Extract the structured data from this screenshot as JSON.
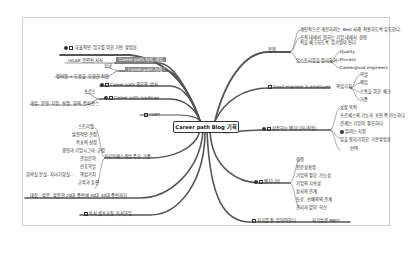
{
  "title": "Career path Blog 기획",
  "left": {
    "item1": "효율적인 업무를 위한 기반 방법론",
    "item2_label": "Career path 서식 개발",
    "item2_child": "ISCAR 관련된 서식",
    "item3_label": "Career path 사례",
    "item3_child_a": "신규",
    "item3_child_b": "정비원 + 도움을 요청한 직원",
    "item4": "Career path 개요와 방식",
    "item5": "Career path roadmap",
    "item5_child_a": "프로드",
    "item5_child_b": "개발, 운영, 지원, 설명, 회의, 컨퍼런스",
    "item6": "COPT",
    "item7": "커리어패스개발 주요 기준",
    "item7_children": [
      "스토리텔",
      "발전적인 관점",
      "목표의 설정",
      "경영과 기업시그마 규정",
      "관심분야",
      "선호역할",
      "핵심가치",
      "교육과 훈련"
    ],
    "item7_extra": "회의실 분실, 자녀기회실...",
    "item8": "대상 : 방문, 방문현 20대 중반에 30대 40대 중반까지",
    "item9": "독서 셀프코칭 독서모임"
  },
  "right": {
    "r1": "목적",
    "r1_children": [
      "개인적으로 개선하려는 Best 사례 적용하도록 유도한다.",
      "조직 내에서 원하는 기업 내에서 경험적을 체크하도록 참가원이 된다",
      "업스트리밍을 정리하기"
    ],
    "r1_sub": [
      "Quality",
      "Process",
      "Careerglood engineers"
    ],
    "r2": "Good engineer & employee",
    "r2_child": "핵심가치",
    "r2_sub": [
      "역할",
      "책임",
      "소통을 위한 체크",
      "기준"
    ],
    "r3": "성장하는 엔지니어(직원)",
    "r3_children": [
      "성장 목적",
      "프로세스의 기능과 포인 즉 가능하다",
      "관계는 기업이 필요하다",
      "알려는 지원",
      "일을 잘하기위한 기본방법론",
      "선택"
    ],
    "r4": "엔지니어",
    "r4_children": [
      "경험",
      "전문성확장",
      "기업의 필요 가능성",
      "기업의 지속성",
      "상사와 관계",
      "동료, 선배와의 관계",
      "관리자 없이 혁신"
    ],
    "r5": "자기를 잘 알아야한다",
    "r5_child": "자기발견 MBTI"
  }
}
